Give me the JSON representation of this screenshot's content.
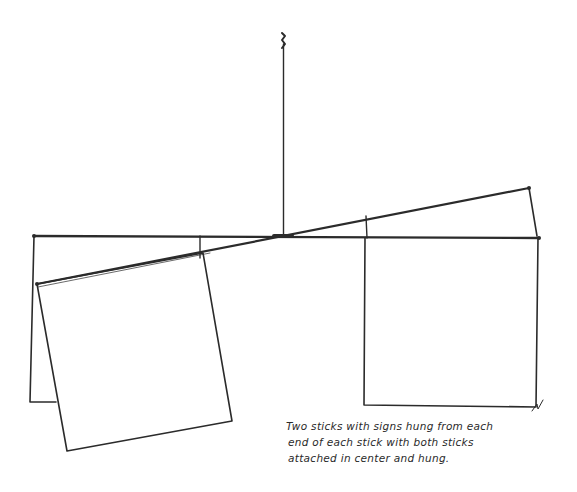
{
  "drawing": {
    "description": "Hand-drawn mobile sketch: a vertical hanging string with two crossing sticks attached at the center, each stick with a square sign hung from each end.",
    "stroke_color": "#2b2b2b",
    "background_color": "#ffffff"
  },
  "caption": {
    "lines": [
      "Two sticks with signs hung from each",
      "end of each stick with both sticks",
      "attached in center and hung."
    ]
  }
}
